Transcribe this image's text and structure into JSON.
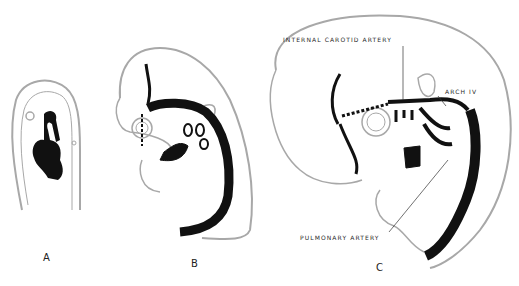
{
  "figure": {
    "panels": [
      {
        "id": "A",
        "label": "A"
      },
      {
        "id": "B",
        "label": "B"
      },
      {
        "id": "C",
        "label": "C"
      }
    ],
    "annotations": {
      "internal_carotid": "INTERNAL CAROTID ARTERY",
      "arch_iv": "ARCH IV",
      "pulmonary": "PULMONARY ARTERY"
    },
    "colors": {
      "outline": "#a8a8a8",
      "vessel": "#111111",
      "background": "#ffffff"
    }
  }
}
